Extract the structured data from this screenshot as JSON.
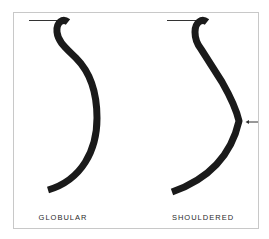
{
  "diagram": {
    "type": "vessel-profile-comparison",
    "colors": {
      "profile": "#1a1a1a",
      "frame": "#c8c8c8",
      "rim_line": "#333333",
      "label": "#2a2a2a"
    },
    "profiles": [
      {
        "id": "globular",
        "label": "GLOBULAR",
        "has_arrow": false
      },
      {
        "id": "shouldered",
        "label": "SHOULDERED",
        "has_arrow": true,
        "arrow_direction": "left",
        "arrow_meaning": "shoulder point"
      }
    ]
  }
}
